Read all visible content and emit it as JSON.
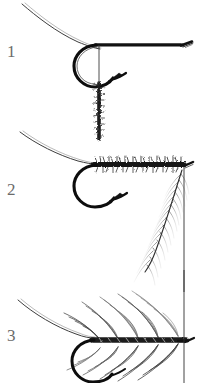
{
  "figure": {
    "kind": "fly-tying-step-illustration",
    "background_color": "#ffffff",
    "ink_color": "#1a1a1a",
    "number_color": "#6b6b6b",
    "width": 201,
    "height": 383,
    "panel_count": 3
  },
  "panels": [
    {
      "number": "1",
      "caption": "",
      "elements": [
        "leader-line",
        "hook-shank",
        "hook-eye",
        "hook-bend",
        "hook-point",
        "hook-barb",
        "hanging-thread",
        "dubbing-noodle"
      ]
    },
    {
      "number": "2",
      "caption": "",
      "elements": [
        "leader-line",
        "hook-shank",
        "hook-eye",
        "hook-bend",
        "hook-point",
        "hook-barb",
        "dubbed-body",
        "hackle-feather",
        "hanging-thread"
      ]
    },
    {
      "number": "3",
      "caption": "",
      "elements": [
        "leader-line",
        "hook-shank",
        "hook-bend",
        "hook-point",
        "dubbed-body",
        "palmered-hackle",
        "hanging-thread"
      ]
    }
  ]
}
